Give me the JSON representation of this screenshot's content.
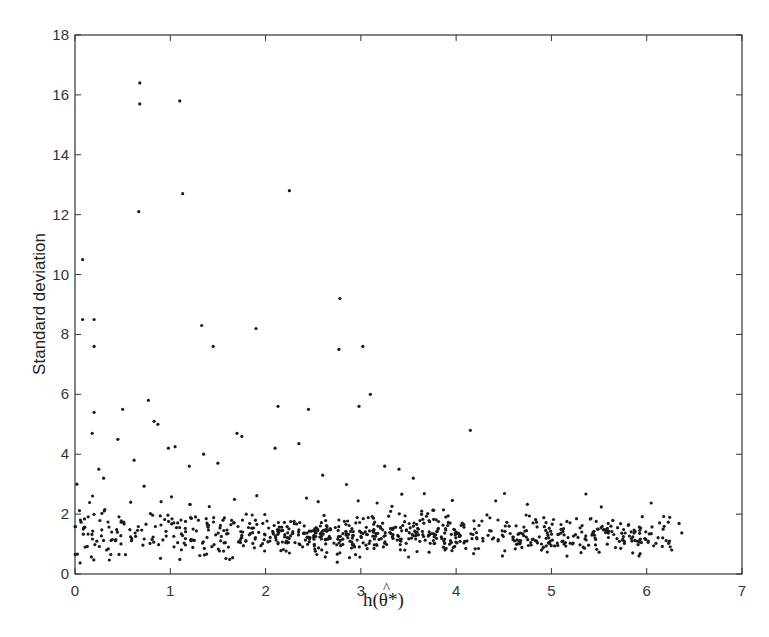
{
  "chart_data": {
    "type": "scatter",
    "title": "",
    "xlabel": "h(θ̂*)",
    "xlabel_parts": {
      "prefix": "h(",
      "hat": "^",
      "symbol": "θ",
      "suffix": "*)"
    },
    "ylabel": "Standard deviation",
    "xlim": [
      0,
      7
    ],
    "ylim": [
      0,
      18
    ],
    "xticks": [
      0,
      1,
      2,
      3,
      4,
      5,
      6,
      7
    ],
    "yticks": [
      0,
      2,
      4,
      6,
      8,
      10,
      12,
      14,
      16,
      18
    ],
    "grid": false,
    "legend": null,
    "marker": {
      "shape": "dot",
      "color": "#1a1a1a",
      "radius": 1.6
    },
    "outliers": [
      [
        0.08,
        10.5
      ],
      [
        0.08,
        8.5
      ],
      [
        0.2,
        8.5
      ],
      [
        0.2,
        7.6
      ],
      [
        0.68,
        16.4
      ],
      [
        0.68,
        15.7
      ],
      [
        0.67,
        12.1
      ],
      [
        1.1,
        15.8
      ],
      [
        1.13,
        12.7
      ],
      [
        2.25,
        12.8
      ],
      [
        1.33,
        8.3
      ],
      [
        1.45,
        7.6
      ],
      [
        1.9,
        8.2
      ],
      [
        2.78,
        9.2
      ],
      [
        2.77,
        7.5
      ],
      [
        3.02,
        7.6
      ],
      [
        2.98,
        5.6
      ],
      [
        3.1,
        6.0
      ],
      [
        4.15,
        4.8
      ],
      [
        2.13,
        5.6
      ],
      [
        2.45,
        5.5
      ],
      [
        0.5,
        5.5
      ],
      [
        0.2,
        5.4
      ],
      [
        0.77,
        5.8
      ],
      [
        0.83,
        5.1
      ],
      [
        0.87,
        5.0
      ],
      [
        0.18,
        4.7
      ],
      [
        1.7,
        4.7
      ],
      [
        1.75,
        4.6
      ],
      [
        0.98,
        4.2
      ],
      [
        1.05,
        4.25
      ],
      [
        0.02,
        3.0
      ],
      [
        0.25,
        3.5
      ],
      [
        0.3,
        3.2
      ],
      [
        0.45,
        4.5
      ],
      [
        0.62,
        3.8
      ],
      [
        1.35,
        4.0
      ],
      [
        1.5,
        3.7
      ],
      [
        2.1,
        4.2
      ],
      [
        2.35,
        4.35
      ],
      [
        3.25,
        3.6
      ],
      [
        3.4,
        3.5
      ],
      [
        2.6,
        3.3
      ],
      [
        3.55,
        3.2
      ],
      [
        1.2,
        3.6
      ]
    ],
    "cluster": {
      "description": "Dense band of ~800 points for h in [0, 6.4], standard deviation mostly between 0.5 and 2.5, densest between h=2.5 and h=4",
      "x_range": [
        0.0,
        6.4
      ],
      "y_center": 1.3,
      "y_spread": 0.45,
      "count": 820
    }
  }
}
